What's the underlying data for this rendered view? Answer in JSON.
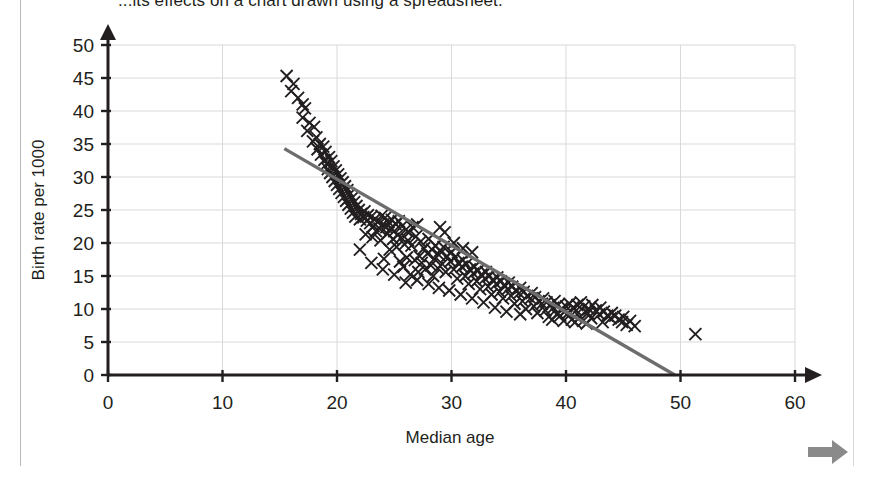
{
  "page": {
    "title_fragment": "...its effects on a chart drawn using a spreadsheet.",
    "background_color": "#ffffff"
  },
  "nav": {
    "next_arrow_label": "next-arrow",
    "next_arrow_color": "#808080"
  },
  "chart_data": {
    "type": "scatter",
    "title": "",
    "xlabel": "Median age",
    "ylabel": "Birth rate per 1000",
    "xlim": [
      0,
      60
    ],
    "ylim": [
      0,
      50
    ],
    "xticks": [
      0,
      10,
      20,
      30,
      40,
      50,
      60
    ],
    "yticks": [
      0,
      5,
      10,
      15,
      20,
      25,
      30,
      35,
      40,
      45,
      50
    ],
    "grid": true,
    "grid_color": "#d9d9d9",
    "marker": "x",
    "marker_color": "#231f20",
    "axis_color": "#231f20",
    "legend": "none",
    "trendline": {
      "label": "line-of-best-fit",
      "color": "#6d6d6d",
      "x_start": 15.4,
      "y_start": 34.3,
      "x_end": 49.5,
      "y_end": 0.0
    },
    "outliers": [
      {
        "x": 51.3,
        "y": 6.2
      }
    ],
    "points": [
      {
        "x": 15.6,
        "y": 45.3
      },
      {
        "x": 16.2,
        "y": 44.1
      },
      {
        "x": 16.0,
        "y": 43.0
      },
      {
        "x": 16.6,
        "y": 42.0
      },
      {
        "x": 17.0,
        "y": 41.0
      },
      {
        "x": 17.2,
        "y": 40.4
      },
      {
        "x": 17.0,
        "y": 39.0
      },
      {
        "x": 17.6,
        "y": 38.2
      },
      {
        "x": 17.4,
        "y": 37.0
      },
      {
        "x": 18.0,
        "y": 37.6
      },
      {
        "x": 18.2,
        "y": 36.0
      },
      {
        "x": 17.9,
        "y": 35.4
      },
      {
        "x": 18.5,
        "y": 35.0
      },
      {
        "x": 18.3,
        "y": 34.2
      },
      {
        "x": 18.8,
        "y": 34.6
      },
      {
        "x": 18.6,
        "y": 33.4
      },
      {
        "x": 19.0,
        "y": 33.8
      },
      {
        "x": 18.9,
        "y": 32.6
      },
      {
        "x": 19.3,
        "y": 33.0
      },
      {
        "x": 19.1,
        "y": 32.0
      },
      {
        "x": 19.5,
        "y": 32.4
      },
      {
        "x": 19.2,
        "y": 31.2
      },
      {
        "x": 19.7,
        "y": 31.6
      },
      {
        "x": 19.4,
        "y": 30.6
      },
      {
        "x": 19.9,
        "y": 31.0
      },
      {
        "x": 19.6,
        "y": 30.0
      },
      {
        "x": 20.1,
        "y": 30.4
      },
      {
        "x": 19.8,
        "y": 29.4
      },
      {
        "x": 20.3,
        "y": 29.8
      },
      {
        "x": 20.0,
        "y": 28.8
      },
      {
        "x": 20.5,
        "y": 29.2
      },
      {
        "x": 20.2,
        "y": 28.2
      },
      {
        "x": 20.7,
        "y": 28.6
      },
      {
        "x": 20.4,
        "y": 27.6
      },
      {
        "x": 20.9,
        "y": 28.0
      },
      {
        "x": 20.6,
        "y": 27.0
      },
      {
        "x": 21.1,
        "y": 27.4
      },
      {
        "x": 20.8,
        "y": 26.4
      },
      {
        "x": 21.3,
        "y": 26.8
      },
      {
        "x": 21.0,
        "y": 25.8
      },
      {
        "x": 21.5,
        "y": 26.2
      },
      {
        "x": 21.2,
        "y": 25.2
      },
      {
        "x": 21.7,
        "y": 25.6
      },
      {
        "x": 21.4,
        "y": 24.6
      },
      {
        "x": 21.9,
        "y": 25.0
      },
      {
        "x": 21.6,
        "y": 24.0
      },
      {
        "x": 22.1,
        "y": 24.4
      },
      {
        "x": 22.4,
        "y": 24.8
      },
      {
        "x": 22.7,
        "y": 24.2
      },
      {
        "x": 22.0,
        "y": 23.6
      },
      {
        "x": 22.3,
        "y": 23.9
      },
      {
        "x": 22.6,
        "y": 23.4
      },
      {
        "x": 23.0,
        "y": 24.0
      },
      {
        "x": 23.3,
        "y": 23.6
      },
      {
        "x": 22.9,
        "y": 23.0
      },
      {
        "x": 23.2,
        "y": 22.6
      },
      {
        "x": 23.6,
        "y": 23.2
      },
      {
        "x": 23.9,
        "y": 24.1
      },
      {
        "x": 24.2,
        "y": 23.8
      },
      {
        "x": 24.5,
        "y": 23.2
      },
      {
        "x": 24.0,
        "y": 22.8
      },
      {
        "x": 24.3,
        "y": 22.4
      },
      {
        "x": 23.7,
        "y": 22.2
      },
      {
        "x": 23.4,
        "y": 21.8
      },
      {
        "x": 24.8,
        "y": 23.5
      },
      {
        "x": 25.1,
        "y": 22.9
      },
      {
        "x": 25.4,
        "y": 23.3
      },
      {
        "x": 24.7,
        "y": 22.2
      },
      {
        "x": 25.0,
        "y": 21.8
      },
      {
        "x": 24.4,
        "y": 21.4
      },
      {
        "x": 25.7,
        "y": 22.6
      },
      {
        "x": 26.0,
        "y": 22.0
      },
      {
        "x": 25.3,
        "y": 21.2
      },
      {
        "x": 24.9,
        "y": 20.6
      },
      {
        "x": 25.6,
        "y": 20.8
      },
      {
        "x": 26.3,
        "y": 21.6
      },
      {
        "x": 26.6,
        "y": 22.4
      },
      {
        "x": 27.0,
        "y": 22.8
      },
      {
        "x": 26.9,
        "y": 21.0
      },
      {
        "x": 26.2,
        "y": 20.4
      },
      {
        "x": 25.9,
        "y": 19.8
      },
      {
        "x": 25.2,
        "y": 19.4
      },
      {
        "x": 24.6,
        "y": 19.0
      },
      {
        "x": 23.8,
        "y": 20.4
      },
      {
        "x": 23.1,
        "y": 20.9
      },
      {
        "x": 22.5,
        "y": 21.3
      },
      {
        "x": 26.5,
        "y": 19.6
      },
      {
        "x": 27.3,
        "y": 20.2
      },
      {
        "x": 27.6,
        "y": 19.2
      },
      {
        "x": 28.0,
        "y": 20.6
      },
      {
        "x": 28.3,
        "y": 19.0
      },
      {
        "x": 27.9,
        "y": 18.4
      },
      {
        "x": 27.2,
        "y": 18.0
      },
      {
        "x": 26.8,
        "y": 17.4
      },
      {
        "x": 26.1,
        "y": 17.8
      },
      {
        "x": 25.5,
        "y": 17.2
      },
      {
        "x": 24.1,
        "y": 17.6
      },
      {
        "x": 25.8,
        "y": 16.4
      },
      {
        "x": 28.6,
        "y": 19.6
      },
      {
        "x": 29.0,
        "y": 18.8
      },
      {
        "x": 29.3,
        "y": 19.4
      },
      {
        "x": 28.9,
        "y": 18.2
      },
      {
        "x": 28.5,
        "y": 17.6
      },
      {
        "x": 29.6,
        "y": 18.0
      },
      {
        "x": 30.0,
        "y": 18.6
      },
      {
        "x": 29.9,
        "y": 17.2
      },
      {
        "x": 29.2,
        "y": 16.8
      },
      {
        "x": 28.8,
        "y": 16.2
      },
      {
        "x": 28.2,
        "y": 16.6
      },
      {
        "x": 27.7,
        "y": 16.0
      },
      {
        "x": 27.1,
        "y": 15.6
      },
      {
        "x": 26.4,
        "y": 15.2
      },
      {
        "x": 30.3,
        "y": 17.8
      },
      {
        "x": 30.6,
        "y": 17.0
      },
      {
        "x": 31.0,
        "y": 17.4
      },
      {
        "x": 30.9,
        "y": 16.4
      },
      {
        "x": 30.2,
        "y": 16.0
      },
      {
        "x": 29.5,
        "y": 15.6
      },
      {
        "x": 31.3,
        "y": 16.8
      },
      {
        "x": 31.6,
        "y": 16.0
      },
      {
        "x": 32.0,
        "y": 16.4
      },
      {
        "x": 31.9,
        "y": 15.4
      },
      {
        "x": 31.2,
        "y": 15.0
      },
      {
        "x": 30.5,
        "y": 14.6
      },
      {
        "x": 32.3,
        "y": 15.8
      },
      {
        "x": 32.6,
        "y": 15.2
      },
      {
        "x": 33.0,
        "y": 15.6
      },
      {
        "x": 32.9,
        "y": 14.6
      },
      {
        "x": 32.2,
        "y": 14.2
      },
      {
        "x": 31.5,
        "y": 13.8
      },
      {
        "x": 33.3,
        "y": 15.0
      },
      {
        "x": 33.6,
        "y": 14.4
      },
      {
        "x": 34.0,
        "y": 14.8
      },
      {
        "x": 33.9,
        "y": 13.8
      },
      {
        "x": 33.2,
        "y": 13.4
      },
      {
        "x": 32.5,
        "y": 13.0
      },
      {
        "x": 34.3,
        "y": 14.2
      },
      {
        "x": 34.6,
        "y": 13.6
      },
      {
        "x": 35.0,
        "y": 14.0
      },
      {
        "x": 34.9,
        "y": 13.0
      },
      {
        "x": 34.2,
        "y": 12.6
      },
      {
        "x": 33.5,
        "y": 12.2
      },
      {
        "x": 35.3,
        "y": 13.4
      },
      {
        "x": 35.6,
        "y": 12.8
      },
      {
        "x": 36.0,
        "y": 13.2
      },
      {
        "x": 35.9,
        "y": 12.4
      },
      {
        "x": 35.2,
        "y": 12.0
      },
      {
        "x": 34.5,
        "y": 11.6
      },
      {
        "x": 36.3,
        "y": 12.6
      },
      {
        "x": 36.6,
        "y": 12.0
      },
      {
        "x": 37.0,
        "y": 12.4
      },
      {
        "x": 36.9,
        "y": 11.6
      },
      {
        "x": 36.2,
        "y": 11.2
      },
      {
        "x": 35.5,
        "y": 10.8
      },
      {
        "x": 37.3,
        "y": 11.8
      },
      {
        "x": 37.6,
        "y": 11.2
      },
      {
        "x": 38.0,
        "y": 11.6
      },
      {
        "x": 37.9,
        "y": 10.8
      },
      {
        "x": 37.2,
        "y": 10.4
      },
      {
        "x": 36.5,
        "y": 10.0
      },
      {
        "x": 38.3,
        "y": 11.0
      },
      {
        "x": 38.6,
        "y": 10.6
      },
      {
        "x": 39.0,
        "y": 11.2
      },
      {
        "x": 38.9,
        "y": 10.2
      },
      {
        "x": 38.2,
        "y": 9.8
      },
      {
        "x": 37.5,
        "y": 9.4
      },
      {
        "x": 39.3,
        "y": 10.6
      },
      {
        "x": 39.6,
        "y": 10.0
      },
      {
        "x": 40.0,
        "y": 10.4
      },
      {
        "x": 39.9,
        "y": 9.6
      },
      {
        "x": 39.2,
        "y": 9.2
      },
      {
        "x": 38.5,
        "y": 8.8
      },
      {
        "x": 40.3,
        "y": 10.8
      },
      {
        "x": 40.6,
        "y": 10.2
      },
      {
        "x": 41.0,
        "y": 10.6
      },
      {
        "x": 40.9,
        "y": 9.8
      },
      {
        "x": 40.2,
        "y": 9.4
      },
      {
        "x": 39.5,
        "y": 9.0
      },
      {
        "x": 41.3,
        "y": 11.0
      },
      {
        "x": 41.6,
        "y": 10.4
      },
      {
        "x": 42.0,
        "y": 10.0
      },
      {
        "x": 41.9,
        "y": 9.4
      },
      {
        "x": 41.2,
        "y": 8.8
      },
      {
        "x": 40.5,
        "y": 8.4
      },
      {
        "x": 42.3,
        "y": 10.6
      },
      {
        "x": 42.6,
        "y": 9.8
      },
      {
        "x": 43.0,
        "y": 10.2
      },
      {
        "x": 42.9,
        "y": 9.2
      },
      {
        "x": 42.2,
        "y": 8.6
      },
      {
        "x": 41.5,
        "y": 8.2
      },
      {
        "x": 43.3,
        "y": 9.6
      },
      {
        "x": 43.6,
        "y": 9.0
      },
      {
        "x": 44.0,
        "y": 9.4
      },
      {
        "x": 43.9,
        "y": 8.6
      },
      {
        "x": 43.2,
        "y": 8.0
      },
      {
        "x": 44.3,
        "y": 9.0
      },
      {
        "x": 44.6,
        "y": 8.4
      },
      {
        "x": 45.0,
        "y": 8.8
      },
      {
        "x": 44.9,
        "y": 8.0
      },
      {
        "x": 45.3,
        "y": 7.6
      },
      {
        "x": 45.6,
        "y": 8.2
      },
      {
        "x": 46.0,
        "y": 7.4
      },
      {
        "x": 40.8,
        "y": 8.0
      },
      {
        "x": 41.8,
        "y": 7.8
      },
      {
        "x": 39.8,
        "y": 8.2
      },
      {
        "x": 38.8,
        "y": 8.4
      },
      {
        "x": 36.0,
        "y": 9.2
      },
      {
        "x": 34.8,
        "y": 9.6
      },
      {
        "x": 33.8,
        "y": 10.2
      },
      {
        "x": 32.8,
        "y": 11.0
      },
      {
        "x": 31.8,
        "y": 11.6
      },
      {
        "x": 30.8,
        "y": 12.2
      },
      {
        "x": 29.8,
        "y": 12.8
      },
      {
        "x": 28.9,
        "y": 13.2
      },
      {
        "x": 28.0,
        "y": 13.8
      },
      {
        "x": 27.0,
        "y": 14.4
      },
      {
        "x": 26.0,
        "y": 14.0
      },
      {
        "x": 25.0,
        "y": 15.2
      },
      {
        "x": 24.0,
        "y": 16.0
      },
      {
        "x": 23.0,
        "y": 17.0
      },
      {
        "x": 22.0,
        "y": 19.0
      },
      {
        "x": 29.0,
        "y": 22.4
      },
      {
        "x": 29.4,
        "y": 21.6
      },
      {
        "x": 30.2,
        "y": 20.0
      },
      {
        "x": 31.0,
        "y": 19.2
      },
      {
        "x": 31.8,
        "y": 18.6
      },
      {
        "x": 28.4,
        "y": 15.0
      },
      {
        "x": 27.4,
        "y": 17.0
      }
    ]
  }
}
